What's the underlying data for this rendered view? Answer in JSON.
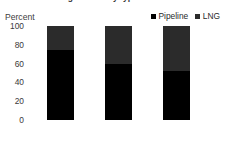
{
  "chart_data": {
    "type": "bar",
    "subtype": "stacked-100-percent",
    "title": "",
    "subtitle": "",
    "xlabel": "",
    "ylabel": "Percent",
    "ylim": [
      0,
      100
    ],
    "yticks": [
      0,
      20,
      40,
      60,
      80,
      100
    ],
    "ytick_labels": [
      "0",
      "20",
      "40",
      "60",
      "80",
      "100"
    ],
    "categories": [
      "2000",
      "2010",
      "2019"
    ],
    "grid": false,
    "legend_position": "top-right",
    "legend": [
      "Pipeline",
      "LNG"
    ],
    "series": [
      {
        "name": "Pipeline",
        "color": "#000000",
        "values": [
          74,
          60,
          52
        ]
      },
      {
        "name": "LNG",
        "color": "#2b2b2b",
        "values": [
          26,
          40,
          48
        ]
      }
    ],
    "annotations": []
  },
  "axes": {
    "y_title": "Percent",
    "y_ticks": [
      {
        "label": "100",
        "value": 100
      },
      {
        "label": "80",
        "value": 80
      },
      {
        "label": "60",
        "value": 60
      },
      {
        "label": "40",
        "value": 40
      },
      {
        "label": "20",
        "value": 20
      },
      {
        "label": "0",
        "value": 0
      }
    ],
    "x_ticks": [
      {
        "label": "2000"
      },
      {
        "label": "2010"
      },
      {
        "label": "2019"
      }
    ]
  },
  "legend": {
    "entries": [
      {
        "label": "Pipeline",
        "color": "#000000"
      },
      {
        "label": "LNG",
        "color": "#2b2b2b"
      }
    ]
  },
  "header": {
    "title_clipped": "Natural gas trade by type"
  },
  "colors": {
    "pipeline": "#000000",
    "lng": "#2b2b2b",
    "axis_line": "#b6b6b6",
    "tick_text": "#3a3a3a",
    "background": "#ffffff"
  }
}
